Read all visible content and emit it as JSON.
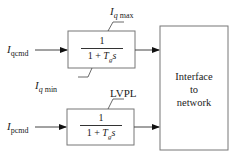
{
  "diagram": {
    "inputs": {
      "top": {
        "symbol": "I",
        "subscript": "qcmd"
      },
      "bottom": {
        "symbol": "I",
        "subscript": "pcmd"
      }
    },
    "blocks": {
      "top": {
        "numerator": "1",
        "denominator_prefix": "1 + ",
        "denominator_T": "T",
        "denominator_sub": "g",
        "denominator_s": "s",
        "limit_max": {
          "symbol": "I",
          "subscript": "q",
          "suffix": "max"
        },
        "limit_min": {
          "symbol": "I",
          "subscript": "q",
          "suffix": "min"
        }
      },
      "bottom": {
        "numerator": "1",
        "denominator_prefix": "1 + ",
        "denominator_T": "T",
        "denominator_sub": "g",
        "denominator_s": "s",
        "limit": "LVPL"
      }
    },
    "interface": {
      "lines": [
        "Interface",
        "to",
        "network"
      ]
    },
    "colors": {
      "line": "#444444",
      "box": "#777777",
      "background": "#ffffff"
    }
  }
}
